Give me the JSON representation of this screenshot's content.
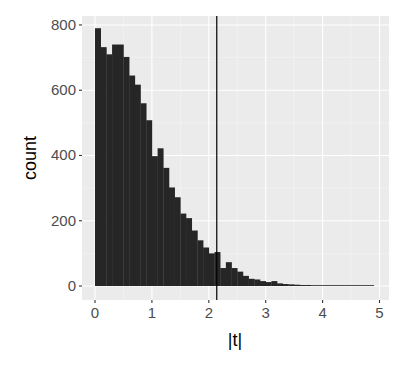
{
  "chart_data": {
    "type": "bar",
    "subtype": "histogram",
    "title": "",
    "xlabel": "|t|",
    "ylabel": "count",
    "bin_width": 0.1,
    "bin_start": 0,
    "x": [
      0.0,
      0.1,
      0.2,
      0.3,
      0.4,
      0.5,
      0.6,
      0.7,
      0.8,
      0.9,
      1.0,
      1.1,
      1.2,
      1.3,
      1.4,
      1.5,
      1.6,
      1.7,
      1.8,
      1.9,
      2.0,
      2.1,
      2.2,
      2.3,
      2.4,
      2.5,
      2.6,
      2.7,
      2.8,
      2.9,
      3.0,
      3.1,
      3.2,
      3.3,
      3.4,
      3.5,
      3.6,
      3.7,
      3.8,
      3.9,
      4.0,
      4.1,
      4.2,
      4.3,
      4.4,
      4.5,
      4.6,
      4.7,
      4.8
    ],
    "values": [
      790,
      732,
      710,
      740,
      740,
      702,
      645,
      617,
      560,
      508,
      398,
      422,
      362,
      302,
      272,
      222,
      208,
      170,
      140,
      118,
      100,
      104,
      55,
      73,
      55,
      44,
      31,
      22,
      20,
      15,
      12,
      15,
      8,
      6,
      5,
      4,
      3,
      3,
      2,
      2,
      1,
      1,
      1,
      1,
      1,
      1,
      1,
      1,
      1
    ],
    "xlim": [
      -0.1,
      5.1
    ],
    "ylim": [
      -40,
      830
    ],
    "x_ticks": [
      0,
      1,
      2,
      3,
      4,
      5
    ],
    "x_tick_labels": [
      "0",
      "1",
      "2",
      "3",
      "4",
      "5"
    ],
    "y_ticks": [
      0,
      200,
      400,
      600,
      800
    ],
    "y_tick_labels": [
      "0",
      "200",
      "400",
      "600",
      "800"
    ],
    "vline": 2.14,
    "grid": true,
    "legend": null,
    "colors": {
      "bar_fill": "#262626",
      "panel_bg": "#ebebeb",
      "grid_major": "#ffffff",
      "grid_minor": "#f5f5f5",
      "vline": "#000000",
      "tick_text": "#4d4d4d"
    }
  },
  "axis": {
    "x_title": "|t|",
    "y_title": "count"
  }
}
